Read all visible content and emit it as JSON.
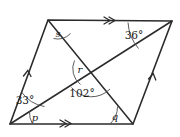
{
  "figure": {
    "kind": "geometry-diagram",
    "shape": "parallelogram-with-diagonals",
    "stroke_color": "#2b2b2b",
    "arc_color": "#4a4a4a",
    "background": "#ffffff"
  },
  "vertices": {
    "bottom_left": {
      "name": "A",
      "x": 10,
      "y": 124
    },
    "top_left": {
      "name": "B",
      "x": 48,
      "y": 20
    },
    "top_right": {
      "name": "C",
      "x": 172,
      "y": 21
    },
    "bottom_right": {
      "name": "D",
      "x": 133,
      "y": 124
    },
    "intersection": {
      "name": "E",
      "x": 89,
      "y": 77
    }
  },
  "angles": [
    {
      "id": "s",
      "label": "s",
      "type": "variable",
      "vertex": "top_left",
      "x": 58,
      "y": 37
    },
    {
      "id": "a36",
      "label": "36°",
      "type": "value",
      "vertex": "top_right",
      "x": 134,
      "y": 39
    },
    {
      "id": "r",
      "label": "r",
      "type": "variable",
      "vertex": "intersection",
      "x": 80,
      "y": 73
    },
    {
      "id": "a102",
      "label": "102°",
      "type": "value",
      "vertex": "intersection",
      "x": 82,
      "y": 97
    },
    {
      "id": "a33",
      "label": "33°",
      "type": "value",
      "vertex": "bottom_left",
      "x": 25,
      "y": 104
    },
    {
      "id": "p",
      "label": "p",
      "type": "variable",
      "vertex": "bottom_left",
      "x": 35,
      "y": 121
    },
    {
      "id": "q",
      "label": "q",
      "type": "variable",
      "vertex": "bottom_right",
      "x": 115,
      "y": 120
    }
  ],
  "parallel_marks": [
    {
      "id": "top-edge-mark",
      "edge": "top",
      "chevrons": 2
    },
    {
      "id": "bottom-edge-mark",
      "edge": "bottom",
      "chevrons": 2
    },
    {
      "id": "left-edge-mark",
      "edge": "left",
      "chevrons": 1
    },
    {
      "id": "right-edge-mark",
      "edge": "right",
      "chevrons": 1
    }
  ]
}
